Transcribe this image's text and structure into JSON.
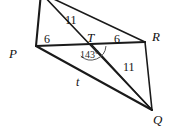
{
  "figure": {
    "kind": "geometry-diagram",
    "stroke_color": "#1a1a1a",
    "background_color": "#ffffff",
    "vertices": [
      {
        "id": "P",
        "label": "P",
        "x": 36,
        "y": 46
      },
      {
        "id": "R",
        "label": "R",
        "x": 145,
        "y": 42
      },
      {
        "id": "Q",
        "label": "Q",
        "x": 152,
        "y": 110
      },
      {
        "id": "T",
        "label": "T",
        "x": 91,
        "y": 44
      }
    ],
    "vertex_labels": [
      {
        "name": "vertex-label-p",
        "text": "P",
        "left": 9,
        "top": 47
      },
      {
        "name": "vertex-label-r",
        "text": "R",
        "left": 152,
        "top": 30
      },
      {
        "name": "vertex-label-q",
        "text": "Q",
        "left": 153,
        "top": 113
      },
      {
        "name": "vertex-label-t",
        "text": "T",
        "left": 87,
        "top": 31
      }
    ],
    "segment_labels": [
      {
        "name": "length-label-pt",
        "text": "6",
        "left": 44,
        "top": 33
      },
      {
        "name": "length-label-tr",
        "text": "6",
        "left": 114,
        "top": 33
      },
      {
        "name": "length-label-upper",
        "text": "11",
        "left": 65,
        "top": 14
      },
      {
        "name": "length-label-tq",
        "text": "11",
        "left": 123,
        "top": 61
      },
      {
        "name": "side-label-t",
        "text": "t",
        "left": 76,
        "top": 76
      }
    ],
    "angle_labels": [
      {
        "name": "angle-label-ptq",
        "text": "143°",
        "left": 80,
        "top": 50
      }
    ]
  },
  "geometry": {
    "apex_x": 41,
    "apex_y": -7,
    "lines": [
      {
        "name": "edge-apex-to-p",
        "from": [
          41,
          -7
        ],
        "to": [
          36,
          46
        ],
        "weight": "line-thick"
      },
      {
        "name": "edge-apex-to-r",
        "from": [
          41,
          -7
        ],
        "to": [
          145,
          42
        ],
        "weight": "line-med"
      },
      {
        "name": "edge-apex-to-q",
        "from": [
          41,
          -7
        ],
        "to": [
          152,
          110
        ],
        "weight": "line-med"
      },
      {
        "name": "edge-p-to-r",
        "from": [
          36,
          46
        ],
        "to": [
          145,
          42
        ],
        "weight": "line-thick"
      },
      {
        "name": "edge-p-to-q",
        "from": [
          36,
          46
        ],
        "to": [
          152,
          110
        ],
        "weight": "line-thick"
      },
      {
        "name": "edge-r-to-q",
        "from": [
          145,
          42
        ],
        "to": [
          152,
          110
        ],
        "weight": "line-med"
      },
      {
        "name": "edge-t-to-q",
        "from": [
          91,
          44
        ],
        "to": [
          152,
          110
        ],
        "weight": "line-thin"
      }
    ],
    "angle_arc": {
      "name": "angle-arc-at-t",
      "center": [
        91,
        45
      ],
      "radius": 15,
      "start_deg": 4,
      "end_deg": 133
    }
  }
}
